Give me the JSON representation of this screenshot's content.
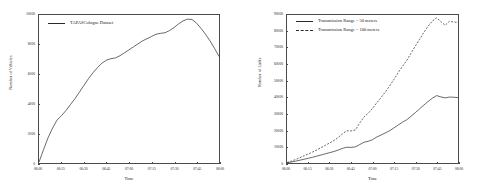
{
  "chart_data": [
    {
      "type": "line",
      "title": "",
      "xlabel": "Time",
      "ylabel": "Number of Vehicles",
      "xticklabels": [
        "06:00",
        "06:15",
        "06:30",
        "06:45",
        "07:00",
        "07:15",
        "07:30",
        "07:45",
        "08:00"
      ],
      "yticklabels": [
        "0",
        "2000",
        "4000",
        "6000",
        "8000",
        "10000"
      ],
      "xlim": [
        0,
        120
      ],
      "ylim": [
        0,
        10000
      ],
      "grid": false,
      "legend_position": "top-left",
      "series": [
        {
          "name": "TAPASCologne Dataset",
          "style": "solid",
          "color": "#2a2a2a",
          "x": [
            0,
            3,
            6,
            9,
            12,
            15,
            18,
            21,
            24,
            27,
            30,
            33,
            36,
            39,
            42,
            45,
            48,
            51,
            54,
            57,
            60,
            63,
            66,
            69,
            72,
            75,
            78,
            81,
            84,
            87,
            90,
            93,
            96,
            99,
            102,
            105,
            108,
            111,
            114,
            117,
            120
          ],
          "values": [
            60,
            900,
            1700,
            2350,
            2900,
            3200,
            3550,
            3950,
            4350,
            4800,
            5250,
            5700,
            6100,
            6450,
            6750,
            6950,
            7050,
            7100,
            7250,
            7450,
            7650,
            7850,
            8050,
            8250,
            8400,
            8550,
            8700,
            8760,
            8800,
            8950,
            9150,
            9400,
            9600,
            9720,
            9700,
            9450,
            9100,
            8700,
            8250,
            7750,
            7200
          ]
        }
      ]
    },
    {
      "type": "line",
      "title": "",
      "xlabel": "Time",
      "ylabel": "Number of Links",
      "xticklabels": [
        "06:00",
        "06:15",
        "06:30",
        "06:45",
        "07:00",
        "07:15",
        "07:30",
        "07:45",
        "08:00"
      ],
      "yticklabels": [
        "0",
        "10000",
        "20000",
        "30000",
        "40000",
        "50000",
        "60000",
        "70000",
        "80000",
        "90000"
      ],
      "xlim": [
        0,
        120
      ],
      "ylim": [
        0,
        90000
      ],
      "grid": false,
      "legend_position": "top-left",
      "series": [
        {
          "name": "Transmission Range = 50 meters",
          "style": "solid",
          "color": "#2a2a2a",
          "x": [
            0,
            3,
            6,
            9,
            12,
            15,
            18,
            21,
            24,
            27,
            30,
            33,
            36,
            39,
            42,
            45,
            48,
            51,
            54,
            57,
            60,
            63,
            66,
            69,
            72,
            75,
            78,
            81,
            84,
            87,
            90,
            93,
            96,
            99,
            102,
            105,
            108,
            111,
            114,
            117,
            120
          ],
          "values": [
            150,
            600,
            1100,
            1700,
            2300,
            2900,
            3500,
            4200,
            4900,
            5600,
            6300,
            7000,
            7900,
            8900,
            9600,
            9500,
            9800,
            11200,
            12600,
            13200,
            14200,
            15800,
            17000,
            18300,
            19600,
            21300,
            23100,
            24800,
            26300,
            28400,
            30600,
            32900,
            35200,
            37400,
            39400,
            41000,
            40200,
            39600,
            40100,
            40000,
            39700
          ]
        },
        {
          "name": "Transmission Range = 100 meters",
          "style": "dashed",
          "color": "#2a2a2a",
          "x": [
            0,
            3,
            6,
            9,
            12,
            15,
            18,
            21,
            24,
            27,
            30,
            33,
            36,
            39,
            42,
            45,
            48,
            51,
            54,
            57,
            60,
            63,
            66,
            69,
            72,
            75,
            78,
            81,
            84,
            87,
            90,
            93,
            96,
            99,
            102,
            105,
            108,
            111,
            114,
            117,
            120
          ],
          "values": [
            300,
            1100,
            2100,
            3200,
            4400,
            5500,
            6700,
            8000,
            9400,
            10800,
            12200,
            13700,
            15600,
            17800,
            19600,
            19500,
            20100,
            24300,
            27900,
            30300,
            33200,
            36600,
            39800,
            43200,
            46800,
            50800,
            54900,
            58800,
            62300,
            66700,
            71000,
            75200,
            79300,
            83200,
            86300,
            88300,
            85900,
            83800,
            86100,
            85800,
            85400
          ]
        }
      ]
    }
  ]
}
